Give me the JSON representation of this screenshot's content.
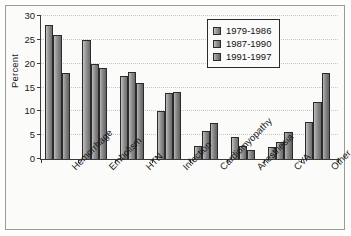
{
  "chart_data": {
    "type": "bar",
    "title": "",
    "subtitle": "",
    "xlabel": "",
    "ylabel": "Percent",
    "ylim": [
      0,
      30
    ],
    "yticks": [
      0,
      5,
      10,
      15,
      20,
      25,
      30
    ],
    "ytick_labels": [
      "0",
      "5",
      "10",
      "15",
      "20",
      "25",
      "30"
    ],
    "grid": true,
    "grid_axis": "y",
    "legend_position": "upper right",
    "categories": [
      "Hemorrhage",
      "Embolism",
      "HTN",
      "Infection",
      "Cardiomyopathy",
      "Anesthesia",
      "CVA",
      "Other"
    ],
    "series": [
      {
        "name": "1979-1986",
        "color": "#9c9c9c",
        "values": [
          28.2,
          25.0,
          17.4,
          10.0,
          2.7,
          4.6,
          2.6,
          7.8
        ]
      },
      {
        "name": "1987-1990",
        "color": "#989898",
        "values": [
          26.0,
          20.0,
          18.2,
          13.8,
          5.8,
          2.8,
          3.6,
          11.9
        ]
      },
      {
        "name": "1991-1997",
        "color": "#8f8f8f",
        "values": [
          18.0,
          19.0,
          16.0,
          14.1,
          7.6,
          1.8,
          5.7,
          18.0
        ]
      }
    ],
    "annotations": []
  },
  "axes": {
    "y_title": "Percent"
  },
  "legend": {
    "entries": [
      {
        "label": "1979-1986",
        "swatch": "legend-swatch-series-1"
      },
      {
        "label": "1987-1990",
        "swatch": "legend-swatch-series-2"
      },
      {
        "label": "1991-1997",
        "swatch": "legend-swatch-series-3"
      }
    ]
  },
  "colors": {
    "axis": "#3a3a3a",
    "grid": "#c9c9c4",
    "frame": "#9a9a96",
    "background": "#fbfbfa",
    "bar_outline": "#2b2b2b"
  }
}
